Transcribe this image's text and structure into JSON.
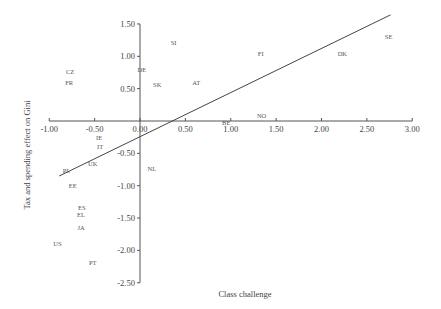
{
  "chart_data": {
    "type": "scatter",
    "title": "",
    "xlabel": "Class challenge",
    "ylabel": "Tax and spending effect on Gini",
    "xlim": [
      -1.0,
      3.0
    ],
    "ylim": [
      -2.5,
      1.5
    ],
    "x_ticks": [
      "-1.00",
      "-0.50",
      "0.00",
      "0.50",
      "1.00",
      "1.50",
      "2.00",
      "2.50",
      "3.00"
    ],
    "y_ticks": [
      "1.50",
      "1.00",
      "0.50",
      "-0.50",
      "-1.00",
      "-1.50",
      "-2.00",
      "-2.50"
    ],
    "grid": false,
    "legend": "none",
    "points": [
      {
        "label": "SI",
        "x": 0.37,
        "y": 1.22
      },
      {
        "label": "CZ",
        "x": -0.77,
        "y": 0.77
      },
      {
        "label": "FR",
        "x": -0.78,
        "y": 0.6
      },
      {
        "label": "DE",
        "x": 0.02,
        "y": 0.8
      },
      {
        "label": "SK",
        "x": 0.19,
        "y": 0.57
      },
      {
        "label": "AT",
        "x": 0.62,
        "y": 0.6
      },
      {
        "label": "FI",
        "x": 1.33,
        "y": 1.04
      },
      {
        "label": "DK",
        "x": 2.23,
        "y": 1.05
      },
      {
        "label": "SE",
        "x": 2.74,
        "y": 1.3
      },
      {
        "label": "NO",
        "x": 1.34,
        "y": 0.08
      },
      {
        "label": "BE",
        "x": 0.95,
        "y": -0.02
      },
      {
        "label": "IE",
        "x": -0.45,
        "y": -0.25
      },
      {
        "label": "IT",
        "x": -0.44,
        "y": -0.4
      },
      {
        "label": "UK",
        "x": -0.52,
        "y": -0.65
      },
      {
        "label": "NL",
        "x": 0.13,
        "y": -0.73
      },
      {
        "label": "PL",
        "x": -0.81,
        "y": -0.76
      },
      {
        "label": "EE",
        "x": -0.74,
        "y": -0.99
      },
      {
        "label": "ES",
        "x": -0.64,
        "y": -1.34
      },
      {
        "label": "EL",
        "x": -0.65,
        "y": -1.45
      },
      {
        "label": "JA",
        "x": -0.65,
        "y": -1.65
      },
      {
        "label": "US",
        "x": -0.91,
        "y": -1.9
      },
      {
        "label": "PT",
        "x": -0.52,
        "y": -2.18
      }
    ],
    "trend_line": {
      "x0": -0.89,
      "y0": -0.85,
      "x1": 2.76,
      "y1": 1.64
    }
  }
}
